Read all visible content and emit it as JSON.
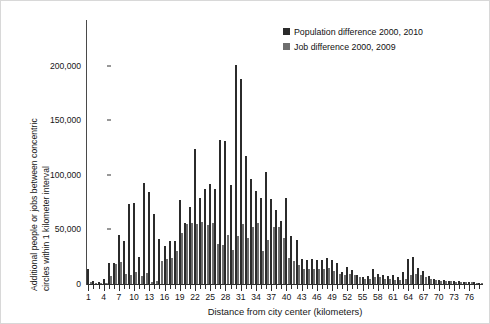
{
  "chart_data": {
    "type": "bar",
    "title": "",
    "subtitle": "",
    "xlabel": "Distance from city center (kilometers)",
    "ylabel": "Additional people or jobs  between concentric\ncircles within 1 kilometer interval",
    "ylim": [
      0,
      220000
    ],
    "ytick_values": [
      0,
      50000,
      100000,
      150000,
      200000
    ],
    "ytick_labels": [
      "0",
      "50,000",
      "100,000",
      "150,000",
      "200,000"
    ],
    "xlim": [
      0.5,
      78.5
    ],
    "xtick_labels": [
      "1",
      "4",
      "7",
      "10",
      "13",
      "16",
      "19",
      "22",
      "25",
      "28",
      "31",
      "34",
      "37",
      "40",
      "43",
      "46",
      "49",
      "52",
      "55",
      "58",
      "61",
      "64",
      "67",
      "70",
      "73",
      "76"
    ],
    "xtick_values": [
      1,
      4,
      7,
      10,
      13,
      16,
      19,
      22,
      25,
      28,
      31,
      34,
      37,
      40,
      43,
      46,
      49,
      52,
      55,
      58,
      61,
      64,
      67,
      70,
      73,
      76
    ],
    "grid": false,
    "legend_position": "top-right",
    "categories": [
      1,
      2,
      3,
      4,
      5,
      6,
      7,
      8,
      9,
      10,
      11,
      12,
      13,
      14,
      15,
      16,
      17,
      18,
      19,
      20,
      21,
      22,
      23,
      24,
      25,
      26,
      27,
      28,
      29,
      30,
      31,
      32,
      33,
      34,
      35,
      36,
      37,
      38,
      39,
      40,
      41,
      42,
      43,
      44,
      45,
      46,
      47,
      48,
      49,
      50,
      51,
      52,
      53,
      54,
      55,
      56,
      57,
      58,
      59,
      60,
      61,
      62,
      63,
      64,
      65,
      66,
      67,
      68,
      69,
      70,
      71,
      72,
      73,
      74,
      75,
      76,
      77,
      78
    ],
    "series": [
      {
        "name": "Population difference 2000, 2010",
        "color": "#2b2b2b",
        "values": [
          14000,
          3000,
          1500,
          5000,
          19000,
          19000,
          45000,
          39000,
          73000,
          74000,
          25000,
          93000,
          84000,
          64000,
          41000,
          35000,
          39000,
          39000,
          77000,
          56000,
          71000,
          124000,
          79000,
          87000,
          92000,
          87000,
          132000,
          131000,
          91000,
          201000,
          188000,
          117000,
          96000,
          85000,
          79000,
          103000,
          78000,
          68000,
          58000,
          79000,
          44000,
          40000,
          23000,
          22000,
          23000,
          22000,
          22000,
          24000,
          22000,
          19000,
          11000,
          16000,
          13000,
          8000,
          6000,
          7000,
          14000,
          9000,
          8000,
          7000,
          8000,
          6000,
          11000,
          23000,
          25000,
          15000,
          12000,
          7000,
          5000,
          4000,
          4000,
          3000,
          3000,
          2500,
          2000,
          2000,
          1500,
          1200
        ]
      },
      {
        "name": "Job difference 2000, 2009",
        "color": "#6e6e6e",
        "values": [
          2000,
          1000,
          800,
          1200,
          7000,
          18000,
          20000,
          9000,
          8000,
          11000,
          7000,
          10000,
          2000,
          3000,
          21000,
          23000,
          24000,
          30000,
          47000,
          55000,
          56000,
          55000,
          57000,
          54000,
          56000,
          37000,
          36000,
          45000,
          31000,
          44000,
          55000,
          42000,
          52000,
          56000,
          30000,
          40000,
          52000,
          52000,
          42000,
          24000,
          21000,
          17000,
          14000,
          14000,
          14000,
          14000,
          14000,
          15000,
          12000,
          9000,
          8000,
          9000,
          8000,
          6000,
          5000,
          5000,
          6000,
          6000,
          5000,
          5000,
          4000,
          4000,
          5000,
          8000,
          9000,
          8000,
          6000,
          5000,
          4000,
          3000,
          3000,
          2500,
          2000,
          2000,
          1500,
          1500,
          1000,
          900
        ]
      }
    ]
  },
  "legend": {
    "items": [
      {
        "label": "Population difference 2000, 2010",
        "color": "#2b2b2b"
      },
      {
        "label": "Job difference 2000, 2009",
        "color": "#6e6e6e"
      }
    ]
  }
}
